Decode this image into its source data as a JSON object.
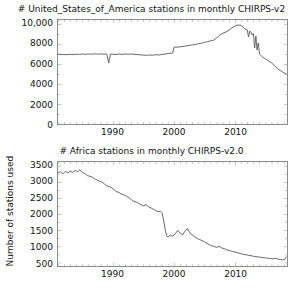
{
  "figure": {
    "width": 303,
    "height": 290,
    "background": "#ffffff",
    "line_color": "#555555",
    "axis_color": "#8c8c8c",
    "text_color": "#111111"
  },
  "chart_data": [
    {
      "type": "line",
      "title": "# United_States_of_America stations in monthly CHIRPS-v2",
      "xlabel": "",
      "ylabel": "",
      "grid": false,
      "legend": "none",
      "xlim": [
        1981,
        2018.5
      ],
      "ylim": [
        0,
        10400
      ],
      "xticks": [
        1990,
        2000,
        2010
      ],
      "xtick_labels": [
        "1990",
        "2000",
        "2010"
      ],
      "yticks": [
        0,
        2000,
        4000,
        6000,
        8000,
        10000
      ],
      "ytick_labels": [
        "0",
        "2000",
        "4000",
        "6000",
        "8000",
        "10,000"
      ],
      "series": [
        {
          "name": "United_States_of_America",
          "color": "#555555",
          "x": [
            1981.0,
            1981.5,
            1982.0,
            1982.5,
            1983.0,
            1983.5,
            1984.0,
            1984.5,
            1985.0,
            1985.5,
            1986.0,
            1986.5,
            1987.0,
            1987.5,
            1988.0,
            1988.5,
            1989.0,
            1989.3,
            1989.6,
            1990.0,
            1990.5,
            1991.0,
            1991.5,
            1992.0,
            1992.5,
            1993.0,
            1993.5,
            1994.0,
            1994.5,
            1995.0,
            1995.5,
            1996.0,
            1996.5,
            1997.0,
            1997.5,
            1998.0,
            1998.5,
            1999.0,
            1999.5,
            1999.8,
            2000.0,
            2000.2,
            2000.5,
            2001.0,
            2001.5,
            2002.0,
            2002.5,
            2003.0,
            2003.5,
            2004.0,
            2004.5,
            2005.0,
            2005.5,
            2006.0,
            2006.5,
            2007.0,
            2007.5,
            2008.0,
            2008.5,
            2009.0,
            2009.5,
            2010.0,
            2010.3,
            2010.6,
            2011.0,
            2011.3,
            2011.6,
            2012.0,
            2012.2,
            2012.4,
            2012.6,
            2012.8,
            2013.0,
            2013.2,
            2013.4,
            2013.6,
            2013.8,
            2014.0,
            2014.5,
            2015.0,
            2015.5,
            2016.0,
            2016.5,
            2017.0,
            2017.5,
            2018.0,
            2018.4
          ],
          "y": [
            6980,
            6960,
            6950,
            6930,
            6960,
            6940,
            6980,
            6960,
            7000,
            6970,
            7010,
            6980,
            7020,
            6990,
            7010,
            6980,
            7000,
            6100,
            6980,
            6980,
            6950,
            7000,
            6960,
            7010,
            6970,
            7000,
            6960,
            6950,
            6910,
            6890,
            6870,
            6900,
            6880,
            6930,
            6900,
            6960,
            6990,
            7050,
            7080,
            7120,
            7680,
            7700,
            7680,
            7720,
            7760,
            7800,
            7860,
            7900,
            7960,
            8020,
            8080,
            8160,
            8240,
            8320,
            8380,
            8620,
            8900,
            9080,
            9200,
            9380,
            9620,
            9800,
            9880,
            9900,
            9860,
            9700,
            9520,
            9400,
            8700,
            9300,
            9180,
            8900,
            9050,
            7600,
            8800,
            7400,
            8100,
            7000,
            6700,
            6500,
            6300,
            6100,
            5800,
            5500,
            5300,
            5100,
            5000
          ]
        }
      ]
    },
    {
      "type": "line",
      "title": "# Africa stations in monthly CHIRPS-v2.0",
      "xlabel": "",
      "ylabel": "Number of stations used",
      "grid": false,
      "legend": "none",
      "xlim": [
        1981,
        2018.5
      ],
      "ylim": [
        400,
        3620
      ],
      "xticks": [
        1990,
        2000,
        2010
      ],
      "xtick_labels": [
        "1990",
        "2000",
        "2010"
      ],
      "yticks": [
        500,
        1000,
        1500,
        2000,
        2500,
        3000,
        3500
      ],
      "ytick_labels": [
        "500",
        "1000",
        "1500",
        "2000",
        "2500",
        "3000",
        "3500"
      ],
      "series": [
        {
          "name": "Africa",
          "color": "#555555",
          "x": [
            1981.0,
            1981.4,
            1981.8,
            1982.2,
            1982.6,
            1983.0,
            1983.4,
            1983.8,
            1984.2,
            1984.6,
            1985.0,
            1985.4,
            1985.8,
            1986.2,
            1986.6,
            1987.0,
            1987.4,
            1987.8,
            1988.2,
            1988.6,
            1989.0,
            1989.4,
            1989.8,
            1990.2,
            1990.6,
            1991.0,
            1991.4,
            1991.8,
            1992.2,
            1992.6,
            1993.0,
            1993.4,
            1993.8,
            1994.2,
            1994.6,
            1995.0,
            1995.4,
            1995.8,
            1996.2,
            1996.6,
            1997.0,
            1997.4,
            1997.8,
            1998.0,
            1998.2,
            1998.4,
            1998.6,
            1998.8,
            1999.0,
            1999.4,
            1999.8,
            2000.2,
            2000.6,
            2001.0,
            2001.4,
            2001.8,
            2002.2,
            2002.6,
            2003.0,
            2003.4,
            2003.8,
            2004.2,
            2004.6,
            2005.0,
            2005.4,
            2005.8,
            2006.2,
            2006.6,
            2007.0,
            2007.4,
            2007.8,
            2008.2,
            2008.6,
            2009.0,
            2009.4,
            2009.8,
            2010.2,
            2010.6,
            2011.0,
            2011.4,
            2011.8,
            2012.2,
            2012.6,
            2013.0,
            2013.4,
            2013.8,
            2014.2,
            2014.6,
            2015.0,
            2015.4,
            2015.8,
            2016.2,
            2016.6,
            2017.0,
            2017.4,
            2017.8,
            2018.1,
            2018.4
          ],
          "y": [
            3290,
            3320,
            3250,
            3330,
            3280,
            3340,
            3300,
            3360,
            3320,
            3380,
            3300,
            3260,
            3200,
            3180,
            3150,
            3100,
            3060,
            3020,
            3000,
            2940,
            2880,
            2860,
            2820,
            2760,
            2700,
            2680,
            2620,
            2600,
            2560,
            2520,
            2460,
            2400,
            2380,
            2340,
            2300,
            2260,
            2300,
            2240,
            2200,
            2160,
            2120,
            2080,
            2100,
            2060,
            1900,
            1700,
            1480,
            1340,
            1300,
            1360,
            1320,
            1400,
            1500,
            1420,
            1360,
            1480,
            1560,
            1420,
            1360,
            1300,
            1250,
            1220,
            1180,
            1150,
            1100,
            1060,
            1020,
            1000,
            980,
            1010,
            960,
            940,
            900,
            880,
            860,
            840,
            820,
            800,
            780,
            760,
            750,
            730,
            720,
            700,
            690,
            680,
            670,
            660,
            650,
            640,
            630,
            620,
            640,
            620,
            600,
            590,
            600,
            680
          ]
        }
      ]
    }
  ],
  "caption": {
    "clipped_text": ""
  }
}
